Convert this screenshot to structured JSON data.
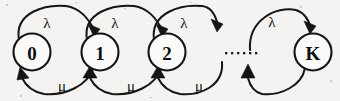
{
  "diagram": {
    "type": "state-transition-diagram",
    "background_color": "#f4f3f1",
    "stroke_color": "#161616",
    "node_fill_color": "#fbfaf8",
    "states": [
      {
        "id": "s0",
        "label": "0",
        "cx": 32,
        "cy": 52,
        "r": 18.5
      },
      {
        "id": "s1",
        "label": "1",
        "cx": 100,
        "cy": 52,
        "r": 18.5
      },
      {
        "id": "s2",
        "label": "2",
        "cx": 167,
        "cy": 52,
        "r": 18.5
      },
      {
        "id": "sK",
        "label": "K",
        "cx": 313,
        "cy": 52,
        "r": 18.5
      }
    ],
    "ellipsis": {
      "label": "......",
      "dot_count": 6,
      "x_start": 225,
      "y": 53,
      "spacing": 6,
      "dot_size": 2.2
    },
    "forward_rate_symbol": "λ",
    "backward_rate_symbol": "μ",
    "forward_transitions": [
      {
        "from": "0",
        "to": "1",
        "label": "λ",
        "label_x": 47,
        "label_y": 23
      },
      {
        "from": "1",
        "to": "2",
        "label": "λ",
        "label_x": 115,
        "label_y": 23
      },
      {
        "from": "2",
        "to": "...",
        "label": "λ",
        "label_x": 184,
        "label_y": 23
      },
      {
        "from": "...",
        "to": "K",
        "label": "λ",
        "label_x": 272,
        "label_y": 22
      }
    ],
    "backward_transitions": [
      {
        "from": "1",
        "to": "0",
        "label": "μ",
        "label_x": 62,
        "label_y": 86
      },
      {
        "from": "2",
        "to": "1",
        "label": "μ",
        "label_x": 131,
        "label_y": 86
      },
      {
        "from": "...",
        "to": "2",
        "label": "μ",
        "label_x": 199,
        "label_y": 86
      },
      {
        "from": "K",
        "to": "...",
        "label": "",
        "label_x": 278,
        "label_y": 86
      }
    ]
  }
}
